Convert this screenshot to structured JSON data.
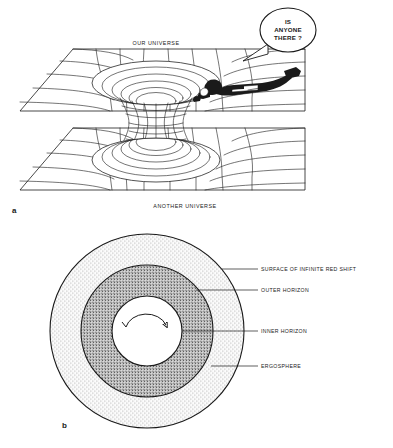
{
  "figure": {
    "panel_a": {
      "letter": "a",
      "top_sheet_label": "OUR UNIVERSE",
      "bottom_sheet_label": "ANOTHER UNIVERSE",
      "speech_bubble": {
        "line1": "IS",
        "line2": "ANYONE",
        "line3": "THERE ?"
      }
    },
    "panel_b": {
      "letter": "b",
      "labels": [
        {
          "text": "SURFACE OF INFINITE RED SHIFT"
        },
        {
          "text": "OUTER HORIZON"
        },
        {
          "text": "INNER HORIZON"
        },
        {
          "text": "ERGOSPHERE"
        }
      ]
    }
  },
  "colors": {
    "ink": "#1a1a1a",
    "background": "#ffffff",
    "outer_ring_stipple": "#b9b9b9",
    "inner_ring_stipple": "#6f6f6f",
    "core": "#ffffff"
  }
}
